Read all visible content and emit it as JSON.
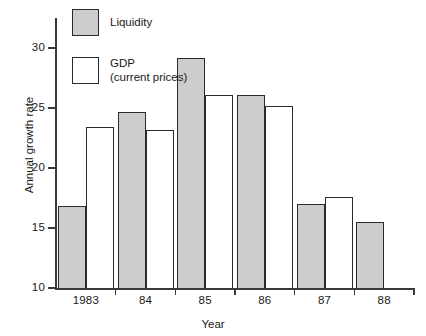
{
  "chart_data": {
    "type": "bar",
    "title": "",
    "xlabel": "Year",
    "ylabel": "Annual growth rate",
    "categories": [
      "1983",
      "84",
      "85",
      "86",
      "87",
      "88"
    ],
    "series": [
      {
        "name": "Liquidity",
        "color": "#cdcdcd",
        "values": [
          16.8,
          24.7,
          29.2,
          26.1,
          17.0,
          15.5
        ]
      },
      {
        "name": "GDP (current prices)",
        "color": "#ffffff",
        "values": [
          23.4,
          23.2,
          26.1,
          25.2,
          17.6,
          null
        ]
      }
    ],
    "ylim": [
      10,
      32
    ],
    "yticks": [
      10,
      15,
      20,
      25,
      30
    ],
    "ytick_labels": [
      "10",
      "15",
      "20",
      "25",
      "30"
    ],
    "grid": false,
    "legend_position": "upper-left-inside"
  },
  "legend": {
    "items": [
      {
        "label": "Liquidity",
        "sub": "",
        "swatch": "liquidity-swatch"
      },
      {
        "label": "GDP",
        "sub": "(current prices)",
        "swatch": "gdp-swatch"
      }
    ]
  },
  "axes": {
    "y_title": "Annual growth rate",
    "x_title": "Year"
  }
}
